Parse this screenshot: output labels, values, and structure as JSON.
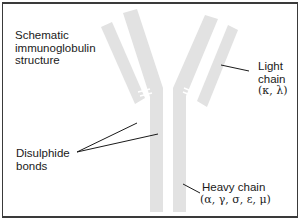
{
  "diagram": {
    "title_lines": [
      "Schematic",
      "immunoglobulin",
      "structure"
    ],
    "labels": {
      "light_chain": {
        "line1": "Light",
        "line2": "chain",
        "line3": "(κ, λ)"
      },
      "disulphide_bonds": {
        "line1": "Disulphide",
        "line2": "bonds"
      },
      "heavy_chain": {
        "line1": "Heavy chain",
        "line2": "(α, γ, σ, ε, μ)"
      }
    },
    "colors": {
      "chain_fill": "#e2e2e2",
      "border": "#3a3a3a",
      "leader_line": "#1a1a1a",
      "bond": "#ffffff"
    }
  }
}
